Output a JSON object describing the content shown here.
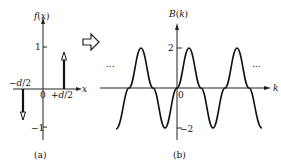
{
  "panel_a": {
    "y_axis_label": "f(x)",
    "x_axis_label": "x",
    "tick_pos": "1",
    "tick_neg": "−1",
    "origin": "0",
    "left_impulse_label": "−d/2",
    "right_impulse_label": "+d/2",
    "caption": "(a)"
  },
  "transform_arrow": {
    "icon": "hollow-right-arrow"
  },
  "panel_b": {
    "y_axis_label": "B(k)",
    "x_axis_label": "k",
    "tick_pos": "2",
    "tick_neg": "−2",
    "origin": "0",
    "left_ellipsis": "...",
    "right_ellipsis": "...",
    "caption": "(b)"
  }
}
